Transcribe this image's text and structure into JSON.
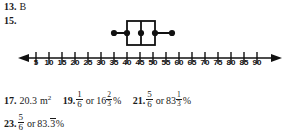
{
  "page": {
    "type": "textbook-answer-key",
    "background": "#ffffff",
    "ink": "#1a1a1a"
  },
  "answers": [
    {
      "number": "13.",
      "text": "B"
    },
    {
      "number": "15.",
      "text": ""
    },
    {
      "number": "17.",
      "value": "20.3",
      "unit": "m",
      "unit_exponent": "2"
    },
    {
      "number": "19.",
      "fraction": {
        "num": "1",
        "den": "6"
      },
      "connector": "or",
      "percent_whole": "16",
      "percent_frac": {
        "num": "2",
        "den": "3"
      },
      "percent_symbol": "%"
    },
    {
      "number": "21.",
      "fraction": {
        "num": "5",
        "den": "6"
      },
      "connector": "or",
      "percent_whole": "83",
      "percent_frac": {
        "num": "1",
        "den": "3"
      },
      "percent_symbol": "%"
    },
    {
      "number": "23.",
      "fraction": {
        "num": "5",
        "den": "6"
      },
      "connector": "or",
      "percent_decimal": "83.",
      "percent_repeating": "3",
      "percent_symbol": "%"
    }
  ],
  "figure": {
    "name": "box-and-whisker-plot",
    "axis": {
      "min_value": 0,
      "max_value": 95,
      "tick_step": 5,
      "tick_labels": [
        "5",
        "10",
        "15",
        "20",
        "25",
        "30",
        "35",
        "40",
        "45",
        "50",
        "55",
        "60",
        "65",
        "70",
        "75",
        "80",
        "85",
        "90"
      ],
      "tick_values": [
        5,
        10,
        15,
        20,
        25,
        30,
        35,
        40,
        45,
        50,
        55,
        60,
        65,
        70,
        75,
        80,
        85,
        90
      ],
      "left_arrow": true,
      "right_arrow": true
    },
    "boxplot": {
      "minimum": 35,
      "q1": 40,
      "median": 45,
      "q3": 51,
      "maximum": 57,
      "point_markers": [
        35,
        40,
        45,
        51,
        57
      ],
      "marker_shape": "filled-circle",
      "stroke": "#111111"
    }
  }
}
